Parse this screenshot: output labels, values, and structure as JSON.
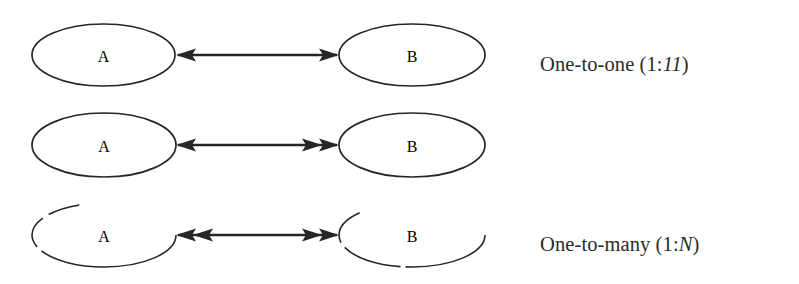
{
  "figure": {
    "background_color": "#ffffff",
    "stroke_color": "#262626",
    "entity_left_label": "A",
    "entity_right_label": "B",
    "rows": [
      {
        "id": "one-to-one",
        "label_plain": "One-to-one (1:1)",
        "label_prefix": "One-to-one (1:",
        "label_left_multiplicity": "1",
        "label_separator": "",
        "label_right_multiplicity": "1",
        "label_suffix": ")",
        "left_arrowheads": 1,
        "right_arrowheads": 1
      },
      {
        "id": "one-to-many",
        "label_plain": "One-to-many (1:N)",
        "label_prefix": "One-to-many (",
        "label_left_multiplicity": "1",
        "label_separator": ":",
        "label_right_multiplicity": "N",
        "label_suffix": ")",
        "left_arrowheads": 1,
        "right_arrowheads": 2
      },
      {
        "id": "many-to-many",
        "label_plain": "Many-to-many (M:N)",
        "label_prefix": "Many-to-many (",
        "label_left_multiplicity": "M",
        "label_separator": ":",
        "label_right_multiplicity": "N",
        "label_suffix": ")",
        "left_arrowheads": 2,
        "right_arrowheads": 2
      }
    ]
  }
}
